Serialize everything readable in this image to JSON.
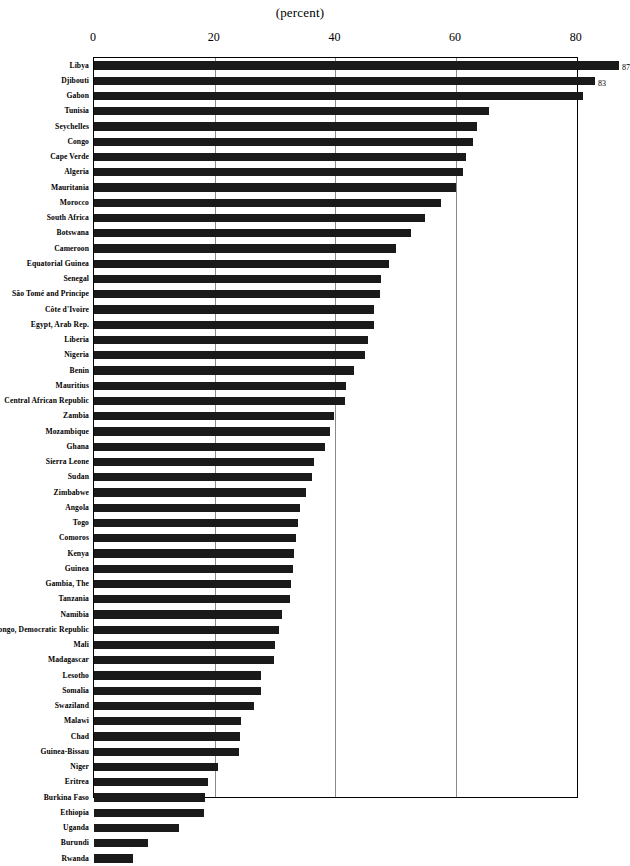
{
  "chart_data": {
    "type": "bar",
    "orientation": "horizontal",
    "title": "(percent)",
    "xlabel": "",
    "ylabel": "",
    "xlim": [
      0,
      80
    ],
    "xticks": [
      0,
      20,
      40,
      60,
      80
    ],
    "grid": true,
    "legend": null,
    "categories": [
      "Libya",
      "Djibouti",
      "Gabon",
      "Tunisia",
      "Seychelles",
      "Congo",
      "Cape Verde",
      "Algeria",
      "Mauritania",
      "Morocco",
      "South Africa",
      "Botswana",
      "Cameroon",
      "Equatorial Guinea",
      "Senegal",
      "São Tomé and Principe",
      "Côte d'Ivoire",
      "Egypt,  Arab Rep.",
      "Liberia",
      "Nigeria",
      "Benin",
      "Mauritius",
      "Central African Republic",
      "Zambia",
      "Mozambique",
      "Ghana",
      "Sierra Leone",
      "Sudan",
      "Zimbabwe",
      "Angola",
      "Togo",
      "Comoros",
      "Kenya",
      "Guinea",
      "Gambia, The",
      "Tanzania",
      "Namibia",
      "Congo, Democratic  Republic",
      "Mali",
      "Madagascar",
      "Lesotho",
      "Somalia",
      "Swaziland",
      "Malawi",
      "Chad",
      "Guinea-Bissau",
      "Niger",
      "Eritrea",
      "Burkina Faso",
      "Ethiopia",
      "Uganda",
      "Burundi",
      "Rwanda"
    ],
    "values": [
      87,
      83,
      81,
      65.5,
      63.5,
      62.8,
      61.6,
      61.1,
      60,
      57.5,
      54.9,
      52.5,
      50,
      48.9,
      47.6,
      47.4,
      46.4,
      46.4,
      45.4,
      44.9,
      43.1,
      41.8,
      41.6,
      39.8,
      39.1,
      38.3,
      36.4,
      36.1,
      35.1,
      34.1,
      33.8,
      33.5,
      33.1,
      33,
      32.6,
      32.5,
      31.1,
      30.6,
      30,
      29.8,
      27.7,
      27.7,
      26.5,
      24.4,
      24.2,
      24,
      20.5,
      18.9,
      18.4,
      18.2,
      14.1,
      8.9,
      6.5
    ],
    "point_labels": {
      "Libya": "87",
      "Djibouti": "83"
    }
  },
  "axis": {
    "ticks": [
      {
        "label": "0",
        "value": 0
      },
      {
        "label": "20",
        "value": 20
      },
      {
        "label": "40",
        "value": 40
      },
      {
        "label": "60",
        "value": 60
      },
      {
        "label": "80",
        "value": 80
      }
    ]
  },
  "colors": {
    "bar": "#1a1a1a",
    "grid": "#8a8a8a",
    "axis": "#000000",
    "background": "#ffffff"
  }
}
